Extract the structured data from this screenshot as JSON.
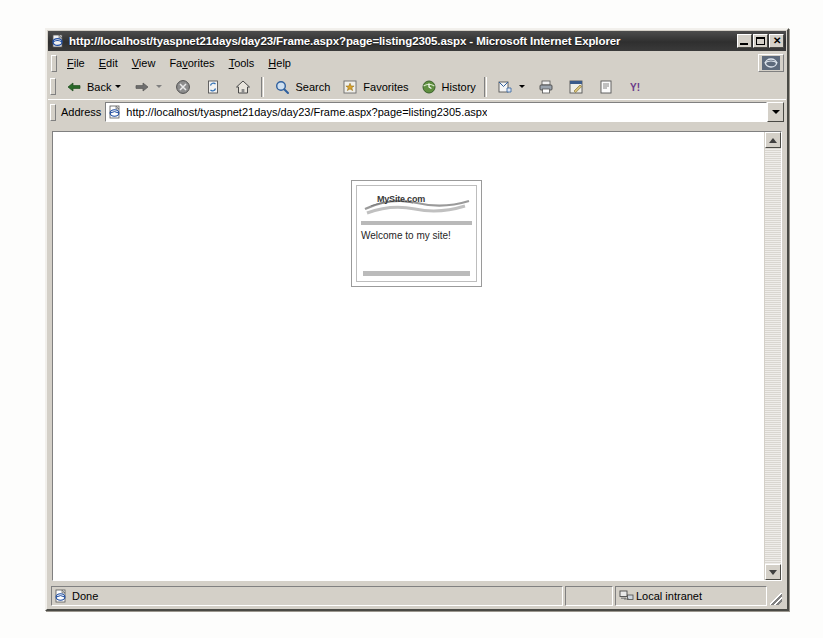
{
  "window": {
    "title": "http://localhost/tyaspnet21days/day23/Frame.aspx?page=listing2305.aspx - Microsoft Internet Explorer",
    "title_icon": "ie-document-icon",
    "controls": {
      "minimize": "minimize-button",
      "maximize": "maximize-button",
      "close": "close-button",
      "close_glyph": "✕"
    }
  },
  "menu": {
    "items": [
      {
        "label": "File",
        "accel": "F",
        "rest": "ile"
      },
      {
        "label": "Edit",
        "accel": "E",
        "rest": "dit"
      },
      {
        "label": "View",
        "accel": "V",
        "rest": "iew"
      },
      {
        "label": "Favorites",
        "pre": "Fa",
        "accel": "v",
        "rest": "orites"
      },
      {
        "label": "Tools",
        "accel": "T",
        "rest": "ools"
      },
      {
        "label": "Help",
        "accel": "H",
        "rest": "elp"
      }
    ],
    "brand_icon": "ie-animated-logo-icon"
  },
  "toolbar": {
    "back_label": "Back",
    "back_icon": "arrow-left-icon",
    "forward_label": "",
    "forward_icon": "arrow-right-icon",
    "stop_icon": "stop-icon",
    "refresh_icon": "refresh-icon",
    "home_icon": "home-icon",
    "search_label": "Search",
    "search_icon": "search-icon",
    "favorites_label": "Favorites",
    "favorites_icon": "favorites-star-icon",
    "history_label": "History",
    "history_icon": "history-clock-icon",
    "mail_icon": "mail-icon",
    "print_icon": "print-icon",
    "edit_icon": "edit-page-icon",
    "discuss_icon": "discuss-icon",
    "messenger_icon": "messenger-icon",
    "messenger_glyph": "Y!"
  },
  "address": {
    "label": "Address",
    "url": "http://localhost/tyaspnet21days/day23/Frame.aspx?page=listing2305.aspx",
    "doc_icon": "ie-document-icon",
    "dropdown_icon": "chevron-down-icon"
  },
  "page": {
    "frame": {
      "logo_text": "MySite.com",
      "logo_icon": "mysite-swoosh-logo",
      "welcome_text": "Welcome to my site!"
    }
  },
  "scrollbar": {
    "up_icon": "scroll-up-arrow-icon",
    "down_icon": "scroll-down-arrow-icon"
  },
  "statusbar": {
    "status_text": "Done",
    "status_icon": "ie-document-icon",
    "zone_text": "Local intranet",
    "zone_icon": "local-intranet-icon"
  }
}
